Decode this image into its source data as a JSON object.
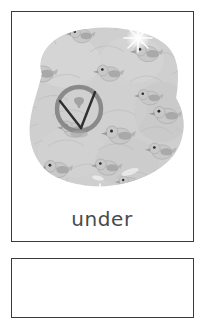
{
  "page": {
    "background_color": "#ffffff",
    "width": 206,
    "height": 265
  },
  "cards": {
    "primary": {
      "border_color": "#3a3a3a",
      "background_color": "#ffffff",
      "word": "under",
      "word_color": "#4a4a4a"
    },
    "secondary": {
      "border_color": "#3a3a3a",
      "background_color": "#ffffff",
      "note": "partially visible card below"
    }
  },
  "illustration": {
    "name": "flock-of-birds-under-blob",
    "description": "grayscale illustration of many small birds clustered together forming a large rounded blob, with a circular marker symbol overlaid at the left",
    "palette": {
      "blob_fill": "#cfcfcf",
      "blob_fill_light": "#dcdcdc",
      "blob_fill_dark": "#bdbdbd",
      "bird_body": "#c6c6c6",
      "bird_outline": "#b2b2b2",
      "bird_accent": "#9a9a9a",
      "bird_eye": "#2b2b2b",
      "marker_ring": "#8a8a8a",
      "marker_line": "#2e2e2e",
      "sparkle": "#ffffff",
      "shadow": "#a8a8a8"
    },
    "marker": {
      "name": "circle-v-marker",
      "shape": "ring with two converging lines forming a V",
      "center_x": 67,
      "center_y": 97,
      "radius": 23
    },
    "sparkles": [
      {
        "x": 126,
        "y": 26,
        "size": 16
      },
      {
        "x": 88,
        "y": 186,
        "size": 15
      },
      {
        "x": 160,
        "y": 172,
        "size": 11
      }
    ],
    "birds": [
      {
        "x": 70,
        "y": 22,
        "scale": 0.85,
        "flip": false
      },
      {
        "x": 136,
        "y": 40,
        "scale": 0.95,
        "flip": false
      },
      {
        "x": 28,
        "y": 60,
        "scale": 1.0,
        "flip": false
      },
      {
        "x": 98,
        "y": 62,
        "scale": 0.9,
        "flip": false
      },
      {
        "x": 137,
        "y": 85,
        "scale": 0.85,
        "flip": false
      },
      {
        "x": 155,
        "y": 103,
        "scale": 0.95,
        "flip": false
      },
      {
        "x": 108,
        "y": 124,
        "scale": 1.0,
        "flip": false
      },
      {
        "x": 152,
        "y": 140,
        "scale": 0.9,
        "flip": false
      },
      {
        "x": 45,
        "y": 160,
        "scale": 0.95,
        "flip": false
      },
      {
        "x": 95,
        "y": 158,
        "scale": 0.9,
        "flip": false
      },
      {
        "x": 62,
        "y": 118,
        "scale": 0.9,
        "flip": false
      }
    ]
  }
}
